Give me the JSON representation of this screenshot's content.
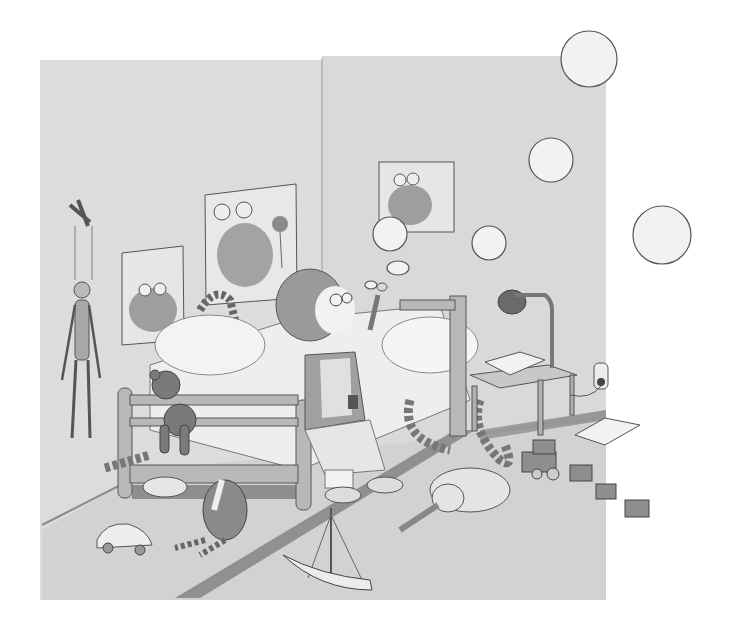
{
  "illustration": {
    "description": "Pencil drawing of a child's bedroom: a shaggy-haired child in overalls sits on a wooden bed blowing soap bubbles; frog posters on the walls, a marionette puppet, a teddy bear, toys scattered on the floor.",
    "style": "grayscale pencil sketch",
    "palette": {
      "paper": "#ffffff",
      "wall": "#dcdcdc",
      "wall_shadow": "#cfcfcf",
      "floor": "#d2d2d2",
      "rug": "#7a7a7a",
      "wood": "#b8b8b8",
      "line": "#4a4a4a",
      "dark": "#6a6a6a",
      "bubble_fill": "#f2f2f2"
    },
    "elements": {
      "posters": [
        "frog poster (left)",
        "frog poster with flower (center)",
        "two frogs poster (right)"
      ],
      "wall_items": [
        "marionette puppet",
        "wall outlet"
      ],
      "furniture": [
        "wooden bed",
        "side table",
        "desk lamp"
      ],
      "characters": [
        "child blowing bubbles",
        "teddy bear",
        "cat under bed",
        "stuffed bird",
        "toy elephant"
      ],
      "floor_toys": [
        "toy car",
        "toy sailboat",
        "toy train with three wagons",
        "open book",
        "striped snake toy"
      ],
      "bubbles_count": 7
    }
  }
}
